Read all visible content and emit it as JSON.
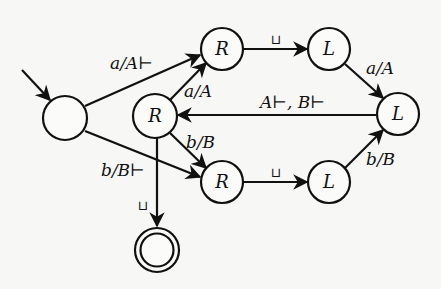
{
  "diagram": {
    "type": "state-machine",
    "nodes": [
      {
        "id": "start",
        "label": "",
        "kind": "initial"
      },
      {
        "id": "r_top",
        "label": "R"
      },
      {
        "id": "l_top",
        "label": "L"
      },
      {
        "id": "r_mid",
        "label": "R"
      },
      {
        "id": "l_right",
        "label": "L"
      },
      {
        "id": "r_bot",
        "label": "R"
      },
      {
        "id": "l_bot",
        "label": "L"
      },
      {
        "id": "accept",
        "label": "",
        "kind": "accepting"
      }
    ],
    "edges": [
      {
        "from": "start",
        "to": "r_top",
        "label": "a/A⊢"
      },
      {
        "from": "start",
        "to": "r_bot",
        "label": "b/B⊢"
      },
      {
        "from": "r_mid",
        "to": "r_top",
        "label": "a/A"
      },
      {
        "from": "r_mid",
        "to": "r_bot",
        "label": "b/B"
      },
      {
        "from": "r_top",
        "to": "l_top",
        "label": "⊔"
      },
      {
        "from": "r_bot",
        "to": "l_bot",
        "label": "⊔"
      },
      {
        "from": "l_top",
        "to": "l_right",
        "label": "a/A"
      },
      {
        "from": "l_bot",
        "to": "l_right",
        "label": "b/B"
      },
      {
        "from": "l_right",
        "to": "r_mid",
        "label": "A⊢, B⊢"
      },
      {
        "from": "r_mid",
        "to": "accept",
        "label": "⊔"
      }
    ]
  },
  "labels": {
    "r_top": "R",
    "l_top": "L",
    "r_mid": "R",
    "l_right": "L",
    "r_bot": "R",
    "l_bot": "L",
    "e_start_rtop": "a/A⊢",
    "e_start_rbot": "b/B⊢",
    "e_rmid_rtop": "a/A",
    "e_rmid_rbot": "b/B",
    "e_rtop_ltop": "⊔",
    "e_rbot_lbot": "⊔",
    "e_ltop_lright": "a/A",
    "e_lbot_lright": "b/B",
    "e_lright_rmid": "A⊢, B⊢",
    "e_rmid_accept": "⊔"
  }
}
